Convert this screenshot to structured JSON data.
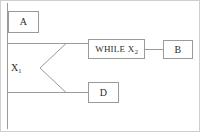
{
  "diagram": {
    "stroke_color": "#9a9a9a",
    "text_color": "#2b2b2b",
    "background_color": "#ffffff",
    "frame_color": "#cfcfcf",
    "nodes": [
      {
        "id": "a",
        "label": "A",
        "sub": "",
        "x": 8,
        "y": 11,
        "w": 31,
        "h": 22
      },
      {
        "id": "while",
        "label": "WHILE X",
        "sub": "2",
        "x": 88,
        "y": 39,
        "w": 57,
        "h": 20
      },
      {
        "id": "b",
        "label": "B",
        "sub": "",
        "x": 163,
        "y": 40,
        "w": 30,
        "h": 19
      },
      {
        "id": "d",
        "label": "D",
        "sub": "",
        "x": 88,
        "y": 82,
        "w": 31,
        "h": 21
      }
    ],
    "trunk_label": {
      "label": "X",
      "sub": "1"
    },
    "edges": [
      {
        "name": "trunk-vertical",
        "from": "top",
        "to": "bottom"
      },
      {
        "name": "branch-upper-horizontal",
        "from": "trunk",
        "to": "fork-upper"
      },
      {
        "name": "fork-upper-diagonal",
        "from": "fork-upper",
        "to": "fork-apex"
      },
      {
        "name": "fork-lower-diagonal",
        "from": "fork-apex",
        "to": "fork-lower"
      },
      {
        "name": "branch-lower-horizontal",
        "from": "trunk",
        "to": "fork-lower"
      },
      {
        "name": "while-to-b-connector",
        "from": "while",
        "to": "b"
      },
      {
        "name": "fork-upper-to-while",
        "from": "fork-upper",
        "to": "while"
      },
      {
        "name": "fork-lower-to-d",
        "from": "fork-lower",
        "to": "d"
      }
    ]
  }
}
